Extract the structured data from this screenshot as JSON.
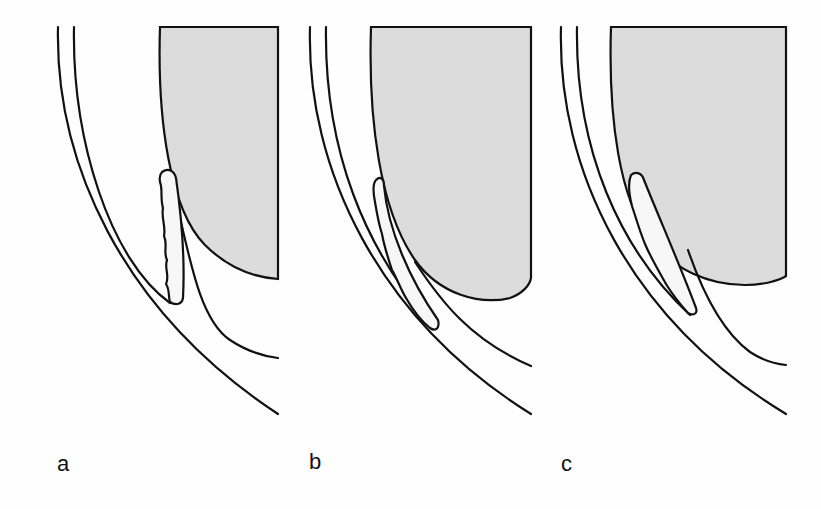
{
  "figure": {
    "panels": [
      {
        "id": "a",
        "label": "a"
      },
      {
        "id": "b",
        "label": "b"
      },
      {
        "id": "c",
        "label": "c"
      }
    ],
    "colors": {
      "lens_fill": "#dcdcdc",
      "stroke": "#111111",
      "background": "#fefefe"
    }
  }
}
